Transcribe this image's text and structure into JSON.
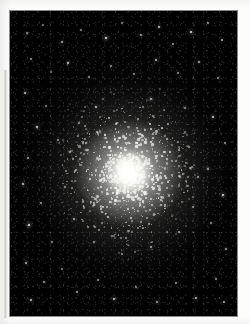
{
  "document": {
    "kind": "scanned-photograph-page",
    "background_color": "#fdfdfc",
    "page_width": 250,
    "page_height": 324,
    "caption": "",
    "title": ""
  },
  "margin_rule": {
    "name": "left-margin-rule",
    "color": "#bdbdb9",
    "x": 4,
    "y": 70,
    "width": 3,
    "height": 248
  },
  "photo": {
    "subject": "globular star cluster",
    "frame": {
      "x": 10,
      "y": 11,
      "width": 227,
      "height": 305
    },
    "sky_color": "#000000",
    "star_color": "#ffffff",
    "core_color": "#fffffc",
    "halo_color": "#cdcdc6",
    "core": {
      "cx": 118,
      "cy": 161,
      "core_radius": 23,
      "halo_radius": 52,
      "outer_radius": 93
    },
    "field_stars": [
      {
        "x": 17,
        "y": 22,
        "r": 0.8,
        "b": 0.55
      },
      {
        "x": 33,
        "y": 14,
        "r": 0.7,
        "b": 0.45
      },
      {
        "x": 52,
        "y": 31,
        "r": 1.0,
        "b": 0.7
      },
      {
        "x": 71,
        "y": 19,
        "r": 0.8,
        "b": 0.5
      },
      {
        "x": 96,
        "y": 27,
        "r": 1.4,
        "b": 0.92
      },
      {
        "x": 112,
        "y": 12,
        "r": 0.7,
        "b": 0.48
      },
      {
        "x": 131,
        "y": 24,
        "r": 0.9,
        "b": 0.62
      },
      {
        "x": 149,
        "y": 16,
        "r": 1.1,
        "b": 0.78
      },
      {
        "x": 163,
        "y": 33,
        "r": 0.8,
        "b": 0.52
      },
      {
        "x": 181,
        "y": 21,
        "r": 1.3,
        "b": 0.88
      },
      {
        "x": 198,
        "y": 12,
        "r": 0.8,
        "b": 0.55
      },
      {
        "x": 212,
        "y": 29,
        "r": 1.0,
        "b": 0.66
      },
      {
        "x": 21,
        "y": 48,
        "r": 0.9,
        "b": 0.6
      },
      {
        "x": 41,
        "y": 61,
        "r": 0.7,
        "b": 0.44
      },
      {
        "x": 58,
        "y": 52,
        "r": 1.2,
        "b": 0.82
      },
      {
        "x": 79,
        "y": 66,
        "r": 0.8,
        "b": 0.5
      },
      {
        "x": 101,
        "y": 55,
        "r": 0.9,
        "b": 0.58
      },
      {
        "x": 124,
        "y": 63,
        "r": 0.8,
        "b": 0.52
      },
      {
        "x": 146,
        "y": 49,
        "r": 1.1,
        "b": 0.75
      },
      {
        "x": 168,
        "y": 62,
        "r": 0.8,
        "b": 0.53
      },
      {
        "x": 189,
        "y": 51,
        "r": 1.0,
        "b": 0.68
      },
      {
        "x": 208,
        "y": 67,
        "r": 0.9,
        "b": 0.57
      },
      {
        "x": 15,
        "y": 82,
        "r": 1.1,
        "b": 0.74
      },
      {
        "x": 36,
        "y": 95,
        "r": 0.8,
        "b": 0.5
      },
      {
        "x": 27,
        "y": 116,
        "r": 1.3,
        "b": 0.86
      },
      {
        "x": 48,
        "y": 129,
        "r": 0.8,
        "b": 0.52
      },
      {
        "x": 18,
        "y": 147,
        "r": 1.0,
        "b": 0.66
      },
      {
        "x": 13,
        "y": 173,
        "r": 1.2,
        "b": 0.8
      },
      {
        "x": 31,
        "y": 192,
        "r": 0.9,
        "b": 0.58
      },
      {
        "x": 19,
        "y": 214,
        "r": 1.4,
        "b": 0.94
      },
      {
        "x": 42,
        "y": 231,
        "r": 0.8,
        "b": 0.51
      },
      {
        "x": 16,
        "y": 252,
        "r": 1.0,
        "b": 0.68
      },
      {
        "x": 34,
        "y": 271,
        "r": 0.9,
        "b": 0.6
      },
      {
        "x": 21,
        "y": 289,
        "r": 1.1,
        "b": 0.76
      },
      {
        "x": 52,
        "y": 258,
        "r": 0.8,
        "b": 0.49
      },
      {
        "x": 67,
        "y": 281,
        "r": 1.0,
        "b": 0.64
      },
      {
        "x": 88,
        "y": 269,
        "r": 0.8,
        "b": 0.52
      },
      {
        "x": 104,
        "y": 288,
        "r": 1.2,
        "b": 0.8
      },
      {
        "x": 126,
        "y": 276,
        "r": 0.8,
        "b": 0.5
      },
      {
        "x": 147,
        "y": 291,
        "r": 1.0,
        "b": 0.67
      },
      {
        "x": 166,
        "y": 272,
        "r": 0.9,
        "b": 0.57
      },
      {
        "x": 186,
        "y": 287,
        "r": 1.1,
        "b": 0.73
      },
      {
        "x": 206,
        "y": 268,
        "r": 0.8,
        "b": 0.52
      },
      {
        "x": 214,
        "y": 291,
        "r": 0.9,
        "b": 0.6
      },
      {
        "x": 203,
        "y": 106,
        "r": 1.2,
        "b": 0.82
      },
      {
        "x": 215,
        "y": 132,
        "r": 0.8,
        "b": 0.52
      },
      {
        "x": 198,
        "y": 158,
        "r": 1.0,
        "b": 0.66
      },
      {
        "x": 213,
        "y": 184,
        "r": 1.3,
        "b": 0.88
      },
      {
        "x": 201,
        "y": 212,
        "r": 0.8,
        "b": 0.5
      },
      {
        "x": 216,
        "y": 238,
        "r": 1.0,
        "b": 0.64
      },
      {
        "x": 175,
        "y": 97,
        "r": 0.9,
        "b": 0.58
      },
      {
        "x": 158,
        "y": 113,
        "r": 0.8,
        "b": 0.5
      },
      {
        "x": 141,
        "y": 88,
        "r": 1.1,
        "b": 0.74
      },
      {
        "x": 86,
        "y": 96,
        "r": 1.0,
        "b": 0.7
      },
      {
        "x": 69,
        "y": 112,
        "r": 0.8,
        "b": 0.51
      },
      {
        "x": 60,
        "y": 141,
        "r": 0.9,
        "b": 0.6
      },
      {
        "x": 55,
        "y": 176,
        "r": 0.8,
        "b": 0.52
      },
      {
        "x": 64,
        "y": 208,
        "r": 1.0,
        "b": 0.66
      },
      {
        "x": 84,
        "y": 231,
        "r": 0.9,
        "b": 0.56
      },
      {
        "x": 112,
        "y": 243,
        "r": 0.8,
        "b": 0.5
      },
      {
        "x": 141,
        "y": 236,
        "r": 1.0,
        "b": 0.64
      },
      {
        "x": 169,
        "y": 221,
        "r": 0.9,
        "b": 0.58
      },
      {
        "x": 183,
        "y": 196,
        "r": 0.8,
        "b": 0.51
      },
      {
        "x": 188,
        "y": 166,
        "r": 1.0,
        "b": 0.62
      },
      {
        "x": 179,
        "y": 136,
        "r": 0.8,
        "b": 0.5
      }
    ]
  }
}
